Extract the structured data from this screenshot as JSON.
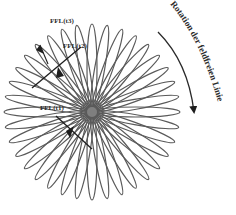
{
  "diagram": {
    "title": "Rotation der feldfreien Linie",
    "center": {
      "x": 92,
      "y": 112
    },
    "petal_count": 36,
    "petal_length": 88,
    "petal_width": 10,
    "stroke_color": "#5a5a5a",
    "labels": {
      "ffl_t1": "FFL(t1)",
      "ffl_t2": "FFL(t2)",
      "ffl_t3": "FFL(t3)",
      "rotation": "Rotation der feldfreien Linie"
    },
    "colors": {
      "petal": "#5a5a5a",
      "line": "#1e1e1e",
      "text": "#2a2a2a",
      "background": "#ffffff"
    }
  }
}
